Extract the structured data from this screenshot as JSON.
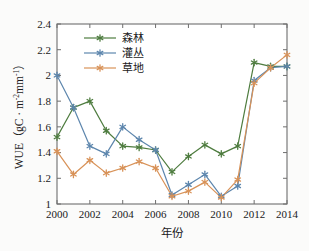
{
  "chart_data": {
    "type": "line",
    "title": "",
    "xlabel": "年份",
    "ylabel": "WUE（gC · m⁻²mm⁻¹）",
    "ylabel_parts": {
      "prefix": "WUE（gC · m",
      "sup1": "-2",
      "mid": "mm",
      "sup2": "-1",
      "suffix": "）"
    },
    "x": [
      2000,
      2001,
      2002,
      2003,
      2004,
      2005,
      2006,
      2007,
      2008,
      2009,
      2010,
      2011,
      2012,
      2013,
      2014
    ],
    "xlim": [
      2000,
      2014
    ],
    "ylim": [
      1.0,
      2.4
    ],
    "xticks": [
      "2000",
      "2002",
      "2004",
      "2006",
      "2008",
      "2010",
      "2012",
      "2014"
    ],
    "xtick_values": [
      2000,
      2002,
      2004,
      2006,
      2008,
      2010,
      2012,
      2014
    ],
    "yticks": [
      "1",
      "1.2",
      "1.4",
      "1.6",
      "1.8",
      "2",
      "2.2",
      "2.4"
    ],
    "ytick_values": [
      1.0,
      1.2,
      1.4,
      1.6,
      1.8,
      2.0,
      2.2,
      2.4
    ],
    "grid": false,
    "legend_position": "upper-left-inside",
    "marker": "asterisk",
    "series": [
      {
        "name": "森林",
        "color": "#4e7c3f",
        "values": [
          1.52,
          1.75,
          1.8,
          1.57,
          1.45,
          1.44,
          1.42,
          1.25,
          1.37,
          1.46,
          1.39,
          1.45,
          2.1,
          2.07,
          2.07
        ]
      },
      {
        "name": "灌丛",
        "color": "#5d86ad",
        "values": [
          2.0,
          1.75,
          1.45,
          1.39,
          1.6,
          1.5,
          1.42,
          1.07,
          1.15,
          1.23,
          1.06,
          1.14,
          1.96,
          2.06,
          2.07
        ]
      },
      {
        "name": "草地",
        "color": "#d89258",
        "values": [
          1.41,
          1.23,
          1.34,
          1.24,
          1.28,
          1.33,
          1.28,
          1.06,
          1.1,
          1.17,
          1.05,
          1.19,
          1.94,
          2.06,
          2.16
        ]
      }
    ]
  },
  "legend": {
    "items": [
      {
        "label": "森林",
        "color": "#4e7c3f"
      },
      {
        "label": "灌丛",
        "color": "#5d86ad"
      },
      {
        "label": "草地",
        "color": "#d89258"
      }
    ]
  },
  "axes": {
    "x_title": "年份",
    "y_title_prefix": "WUE（gC · m",
    "y_title_sup1": "-2",
    "y_title_mid": "mm",
    "y_title_sup2": "-1",
    "y_title_suffix": "）",
    "frame_color": "#6e6e6e"
  }
}
